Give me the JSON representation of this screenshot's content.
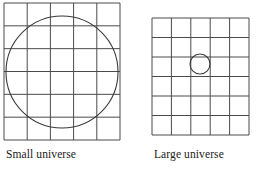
{
  "figure": {
    "type": "diagram",
    "background_color": "#ffffff",
    "line_color": "#4a4a4a",
    "circle_color": "#3a3a3a",
    "text_color": "#1a1a1a",
    "panels": [
      {
        "id": "small-universe",
        "caption": "Small universe",
        "caption_x": 6,
        "caption_y": 155,
        "grid": {
          "x": 4,
          "y": 3,
          "width": 116,
          "height": 137,
          "columns": 5,
          "rows": 6,
          "cell_width": 23.2,
          "cell_height": 22.83
        },
        "circle": {
          "cx": 62,
          "cy": 72,
          "r": 56,
          "relative_size": "large",
          "description": "circle nearly fills the grid"
        }
      },
      {
        "id": "large-universe",
        "caption": "Large universe",
        "caption_x": 154,
        "caption_y": 155,
        "grid": {
          "x": 152,
          "y": 18,
          "width": 97,
          "height": 117,
          "columns": 5,
          "rows": 6,
          "cell_width": 19.4,
          "cell_height": 19.5
        },
        "circle": {
          "cx": 200,
          "cy": 64,
          "r": 10,
          "relative_size": "small",
          "description": "circle fits inside a single grid cell"
        }
      }
    ]
  }
}
